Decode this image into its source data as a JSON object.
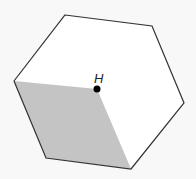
{
  "diagram": {
    "type": "hexagon-with-shaded-rhombus",
    "colors": {
      "background": "#f8f8f8",
      "hexagon_fill": "#ffffff",
      "stroke": "#333333",
      "shaded_fill": "#c4c4c4",
      "point": "#000000"
    },
    "hexagon_vertices": [
      [
        65,
        15
      ],
      [
        152,
        26
      ],
      [
        184,
        103
      ],
      [
        131,
        169
      ],
      [
        46,
        158
      ],
      [
        14,
        81
      ]
    ],
    "shaded_region_vertices": [
      [
        14,
        81
      ],
      [
        97,
        89
      ],
      [
        131,
        169
      ],
      [
        46,
        158
      ]
    ],
    "point": {
      "label": "H",
      "x": 97,
      "y": 89
    }
  }
}
